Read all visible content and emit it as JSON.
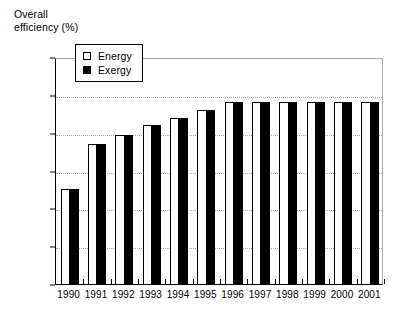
{
  "chart_data": {
    "type": "bar",
    "title": "Overall\nefficiency (%)",
    "xlabel": "",
    "ylabel": "Overall efficiency (%)",
    "ylim": [
      21.3,
      22.5
    ],
    "ytick_step": 0.2,
    "ytick_labels": [
      "22.5",
      "22.3",
      "22.1",
      "21.9",
      "21.7",
      "21.5",
      "21.3"
    ],
    "ytick_values": [
      22.5,
      22.3,
      22.1,
      21.9,
      21.7,
      21.5,
      21.3
    ],
    "gridlines": [
      22.3,
      22.1,
      21.9,
      21.7,
      21.5
    ],
    "grid": true,
    "legend_position": "upper-left-inside",
    "categories": [
      "1990",
      "1991",
      "1992",
      "1993",
      "1994",
      "1995",
      "1996",
      "1997",
      "1998",
      "1999",
      "2000",
      "2001"
    ],
    "series": [
      {
        "name": "Energy",
        "color": "#ffffff",
        "edge_color": "#000000",
        "values": [
          21.8,
          22.04,
          22.09,
          22.14,
          22.18,
          22.22,
          22.26,
          22.26,
          22.26,
          22.26,
          22.26,
          22.26
        ]
      },
      {
        "name": "Exergy",
        "color": "#000000",
        "edge_color": "#000000",
        "values": [
          21.8,
          22.04,
          22.09,
          22.14,
          22.18,
          22.22,
          22.26,
          22.26,
          22.26,
          22.26,
          22.26,
          22.26
        ]
      }
    ]
  },
  "legend": {
    "entries": [
      {
        "label": "Energy",
        "swatch": "open-square"
      },
      {
        "label": "Exergy",
        "swatch": "filled-square"
      }
    ]
  }
}
